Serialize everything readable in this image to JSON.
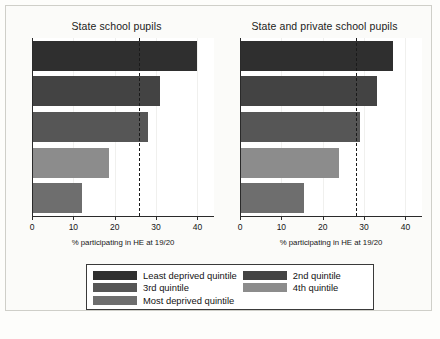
{
  "chart_data": {
    "type": "bar",
    "orientation": "horizontal",
    "title": "",
    "xlabel": "% participating in HE at 19/20",
    "ylabel": "",
    "xlim": [
      0,
      44
    ],
    "xticks": [
      0,
      10,
      20,
      30,
      40
    ],
    "xticklabels": [
      "0",
      "10",
      "20",
      "30",
      "40"
    ],
    "grid": false,
    "legend_position": "bottom",
    "categories": [
      "Least deprived quintile",
      "2nd quintile",
      "3rd quintile",
      "4th quintile",
      "Most deprived quintile"
    ],
    "colors": [
      "#2f2f2f",
      "#434343",
      "#565656",
      "#8c8c8c",
      "#6e6e6e"
    ],
    "panels": [
      {
        "title": "State school pupils",
        "values": [
          40.0,
          31.0,
          28.0,
          18.5,
          12.0
        ],
        "reference_line": 25.8
      },
      {
        "title": "State and private school pupils",
        "values": [
          37.0,
          33.0,
          29.0,
          24.0,
          15.5
        ],
        "reference_line": 28.0
      }
    ],
    "legend": [
      {
        "label": "Least deprived quintile",
        "color": "#2f2f2f"
      },
      {
        "label": "2nd quintile",
        "color": "#434343"
      },
      {
        "label": "3rd quintile",
        "color": "#565656"
      },
      {
        "label": "4th quintile",
        "color": "#8c8c8c"
      },
      {
        "label": "Most deprived quintile",
        "color": "#6e6e6e"
      }
    ]
  }
}
